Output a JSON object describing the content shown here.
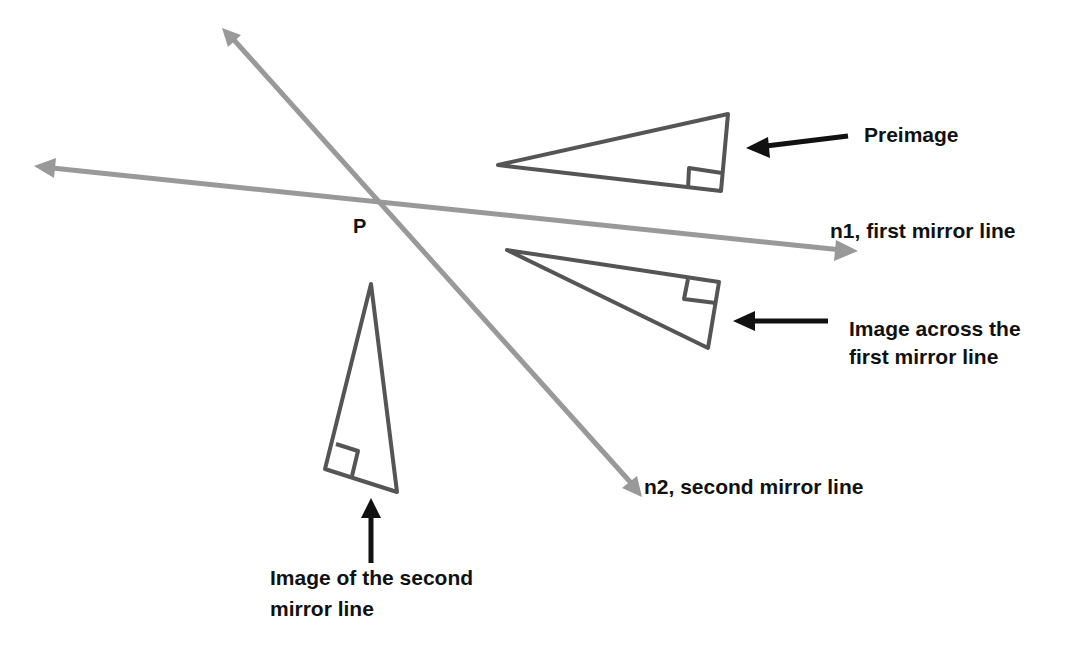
{
  "diagram": {
    "colors": {
      "mirror_line": "#999999",
      "triangle": "#555555",
      "pointer_arrow": "#111111",
      "text": "#111111",
      "background": "#ffffff"
    },
    "point": {
      "label": "P"
    },
    "mirror_lines": [
      {
        "id": "n1",
        "label": "n1, first mirror line"
      },
      {
        "id": "n2",
        "label": "n2, second mirror line"
      }
    ],
    "triangles": [
      {
        "id": "preimage",
        "label": "Preimage"
      },
      {
        "id": "image1",
        "label_line1": "Image across the",
        "label_line2": "first mirror line"
      },
      {
        "id": "image2",
        "label_line1": "Image of the second",
        "label_line2": "mirror line"
      }
    ]
  }
}
